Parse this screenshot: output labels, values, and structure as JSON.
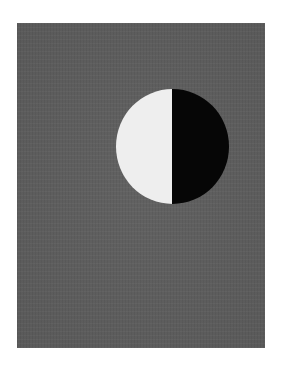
{
  "artwork": {
    "description": "Gray rectangular field with a circle split vertically: left half white, right half black",
    "colors": {
      "background": "#ffffff",
      "field": "#5f5f5f",
      "light_half": "#eeeeee",
      "dark_half": "#060606"
    }
  }
}
